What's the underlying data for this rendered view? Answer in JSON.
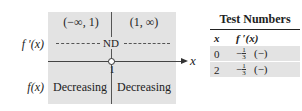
{
  "diagram": {
    "intervals": [
      "(−∞, 1)",
      "(1, ∞)"
    ],
    "derivative_label": "f ′(x)",
    "function_label": "f(x)",
    "nd_label": "ND",
    "critical_point": "1",
    "axis_label": "x",
    "behaviors": [
      "Decreasing",
      "Decreasing"
    ],
    "shade_color": "#e3e3e3"
  },
  "table": {
    "title": "Test Numbers",
    "headers": [
      "x",
      "f ′(x)"
    ],
    "rows": [
      {
        "x": "0",
        "sign_prefix": "−",
        "num": "1",
        "den": "3",
        "sign": "(−)"
      },
      {
        "x": "2",
        "sign_prefix": "−",
        "num": "1",
        "den": "3",
        "sign": "(−)"
      }
    ]
  }
}
